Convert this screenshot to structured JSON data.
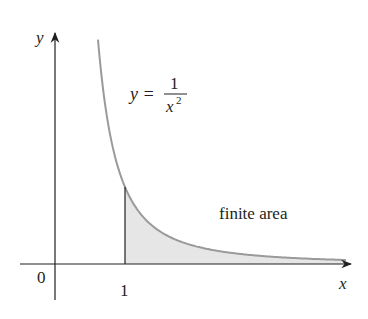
{
  "chart_data": {
    "type": "area",
    "title": "",
    "function_label": {
      "lhs": "y =",
      "numerator": "1",
      "denominator": "x",
      "exponent": "2"
    },
    "xlabel": "x",
    "ylabel": "y",
    "origin_label": "0",
    "tick_labels": [
      "1"
    ],
    "annotation": "finite area",
    "shaded_region": {
      "from_x": 1,
      "to_x": "infinity",
      "under": "y = 1/x^2"
    },
    "grid": false,
    "legend": "none",
    "colors": {
      "curve": "#9a9a9a",
      "shade": "#e6e6e6",
      "axes": "#231f20"
    }
  }
}
